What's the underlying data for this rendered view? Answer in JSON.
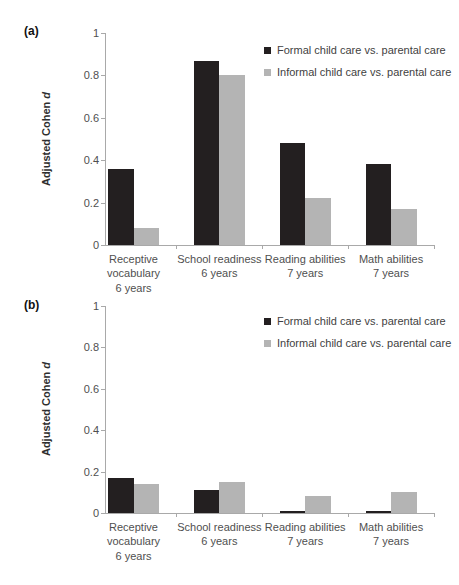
{
  "figure": {
    "background": "#ffffff",
    "ylabel_prefix": "Adjusted Cohen",
    "ylabel_italic": "d"
  },
  "colors": {
    "formal_bar": "#231f20",
    "informal_bar": "#b4b4b4",
    "axis_line": "#a9a9a9",
    "tick_text": "#4f4f4f",
    "legend_text": "#3f3f3f"
  },
  "chart_data": [
    {
      "type": "bar",
      "panel_label": "(a)",
      "title": "",
      "xlabel": "",
      "ylabel": "Adjusted Cohen d",
      "ylim": [
        0,
        1
      ],
      "yticks": [
        0,
        0.2,
        0.4,
        0.6,
        0.8,
        1
      ],
      "ytick_labels": [
        "0",
        "0.2",
        "0.4",
        "0.6",
        "0.8",
        "1"
      ],
      "grid": false,
      "legend_position": "top-right",
      "categories": [
        "Receptive\nvocabulary\n6 years",
        "School readiness\n6 years",
        "Reading abilities\n7 years",
        "Math abilities\n7 years"
      ],
      "series": [
        {
          "name": "Formal child care vs. parental care",
          "color": "#231f20",
          "values": [
            0.36,
            0.87,
            0.48,
            0.38
          ]
        },
        {
          "name": "Informal child care vs. parental care",
          "color": "#b4b4b4",
          "values": [
            0.08,
            0.8,
            0.22,
            0.17
          ]
        }
      ]
    },
    {
      "type": "bar",
      "panel_label": "(b)",
      "title": "",
      "xlabel": "",
      "ylabel": "Adjusted Cohen d",
      "ylim": [
        0,
        1
      ],
      "yticks": [
        0,
        0.2,
        0.4,
        0.6,
        0.8,
        1
      ],
      "ytick_labels": [
        "0",
        "0.2",
        "0.4",
        "0.6",
        "0.8",
        "1"
      ],
      "grid": false,
      "legend_position": "top-right",
      "categories": [
        "Receptive\nvocabulary\n6 years",
        "School readiness\n6 years",
        "Reading abilities\n7 years",
        "Math abilities\n7 years"
      ],
      "series": [
        {
          "name": "Formal child care vs. parental care",
          "color": "#231f20",
          "values": [
            0.17,
            0.11,
            0.01,
            0.01
          ]
        },
        {
          "name": "Informal child care vs. parental care",
          "color": "#b4b4b4",
          "values": [
            0.14,
            0.15,
            0.08,
            0.1
          ]
        }
      ]
    }
  ]
}
